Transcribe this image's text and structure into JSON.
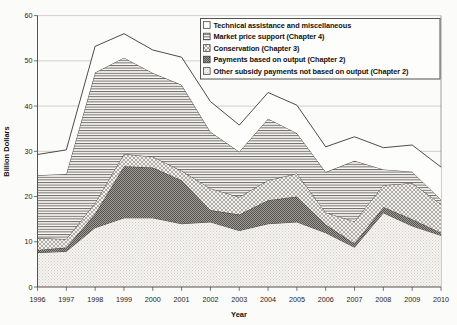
{
  "figure": {
    "background": "#fbfbf9"
  },
  "chart_data": {
    "type": "area",
    "stacked": true,
    "title": "",
    "xlabel": "Year",
    "ylabel": "Billion Dollars",
    "x": [
      1996,
      1997,
      1998,
      1999,
      2000,
      2001,
      2002,
      2003,
      2004,
      2005,
      2006,
      2007,
      2008,
      2009,
      2010
    ],
    "y_ticks": [
      0,
      10,
      20,
      30,
      40,
      50,
      60
    ],
    "ylim": [
      0,
      60
    ],
    "grid": true,
    "legend_position": "top-right",
    "series": [
      {
        "name": "Other subsidy payments not based on output (Chapter 2)",
        "pattern": "dots-light",
        "values": [
          7.6,
          7.9,
          13.1,
          15.3,
          15.3,
          14.0,
          14.4,
          12.5,
          14.0,
          14.4,
          12.0,
          8.8,
          16.4,
          13.5,
          11.4
        ]
      },
      {
        "name": "Payments based on output (Chapter 2)",
        "pattern": "dots-dark",
        "values": [
          0.6,
          0.8,
          3.1,
          11.4,
          11.1,
          9.6,
          2.6,
          3.5,
          5.2,
          5.6,
          1.8,
          0.8,
          1.3,
          1.5,
          0.6
        ]
      },
      {
        "name": "Conservation (Chapter 3)",
        "pattern": "crosshatch",
        "values": [
          2.6,
          1.9,
          2.4,
          2.7,
          2.4,
          2.1,
          4.8,
          3.9,
          4.4,
          5.1,
          2.7,
          4.9,
          4.8,
          8.0,
          6.3
        ]
      },
      {
        "name": "Market price support (Chapter 4)",
        "pattern": "hlines",
        "values": [
          13.9,
          14.4,
          28.8,
          21.3,
          18.5,
          19.0,
          12.5,
          10.0,
          13.6,
          8.9,
          8.9,
          13.4,
          3.5,
          2.5,
          1.0
        ]
      },
      {
        "name": "Technical assistance and miscellaneous",
        "pattern": "plain",
        "values": [
          4.6,
          5.3,
          5.8,
          5.3,
          5.1,
          6.1,
          6.7,
          5.9,
          5.8,
          6.2,
          5.6,
          5.3,
          4.8,
          5.9,
          7.2
        ]
      }
    ],
    "colors": {
      "ink": "#3a3834",
      "axis": "#55534f",
      "grid": "#bdbbb6",
      "plot_border": "#8a8884",
      "legend_border": "#55534f",
      "pattern_dark": "#55524e",
      "pattern_mid": "#6e6b66",
      "pattern_light_dot": "#cfccc6",
      "paper": "#fdfdfb"
    }
  }
}
